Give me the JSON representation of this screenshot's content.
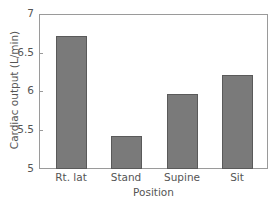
{
  "chart_data": {
    "type": "bar",
    "title": "",
    "xlabel": "Position",
    "ylabel": "Cardiac output (L/min)",
    "categories": [
      "Rt. lat",
      "Stand",
      "Supine",
      "Sit"
    ],
    "values": [
      6.72,
      5.43,
      5.97,
      6.21
    ],
    "ylim": [
      5,
      7
    ],
    "yticks": [
      "5",
      "5.5",
      "6",
      "6.5",
      "7"
    ],
    "grid": false,
    "legend": null,
    "bar_color": "#7a7a7a"
  }
}
